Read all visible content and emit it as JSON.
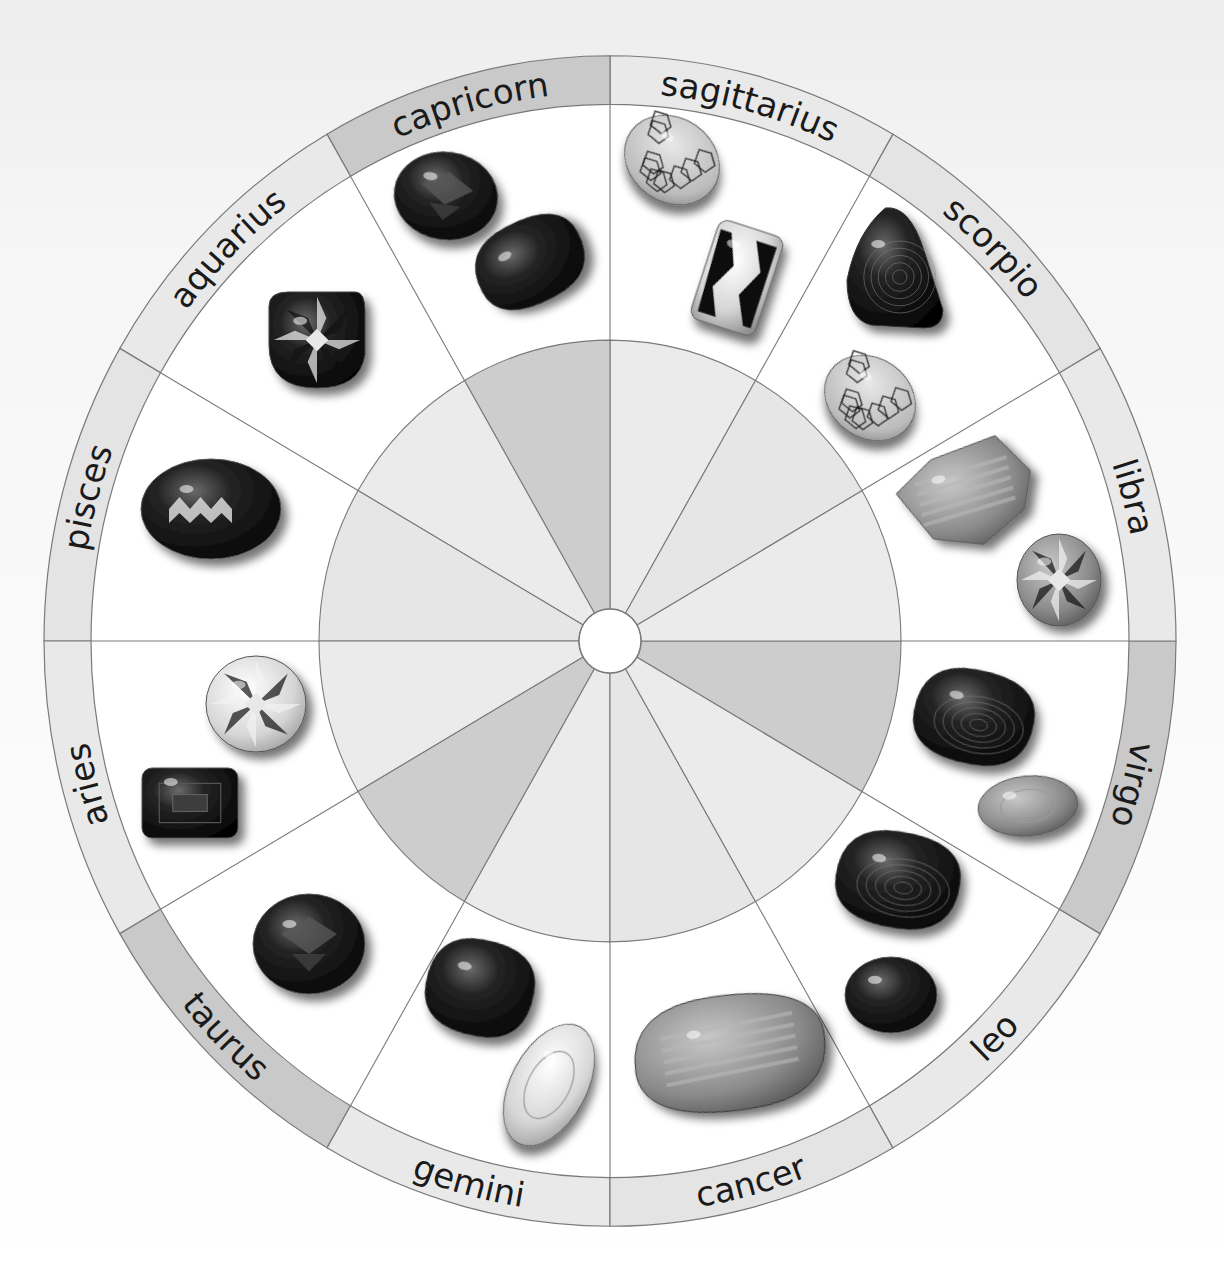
{
  "page": {
    "title_partial": "BIRTHSTONE"
  },
  "wheel": {
    "center": [
      610,
      641
    ],
    "outer_radius": 566,
    "ring_inner_radius": 519,
    "disc_radius": 291,
    "hub_radius": 31,
    "y_stretch": 1.034,
    "colors": {
      "background": "#f4f4f4",
      "ring_light": "#e9e9e9",
      "ring_dark": "#c9c9c9",
      "disc_light": "#ebebeb",
      "disc_dark": "#cdcdcd",
      "line": "#7a7a7a",
      "label": "#1a1a1a"
    }
  },
  "signs": [
    {
      "name": "sagittarius",
      "start_deg": 60,
      "end_deg": 90,
      "shade": "light",
      "flip": false,
      "gems": [
        "turquoise-cabochon",
        "topaz-cushion-cut"
      ]
    },
    {
      "name": "capricorn",
      "start_deg": 90,
      "end_deg": 120,
      "shade": "dark",
      "flip": false,
      "gems": [
        "garnet-cushion-cut",
        "onyx-tumbled"
      ]
    },
    {
      "name": "aquarius",
      "start_deg": 120,
      "end_deg": 150,
      "shade": "light",
      "flip": false,
      "gems": [
        "amethyst-checkerboard-cut"
      ]
    },
    {
      "name": "pisces",
      "start_deg": 150,
      "end_deg": 180,
      "shade": "light",
      "flip": false,
      "gems": [
        "aquamarine-oval-cut"
      ]
    },
    {
      "name": "aries",
      "start_deg": 180,
      "end_deg": 210,
      "shade": "light",
      "flip": false,
      "gems": [
        "diamond-round-brilliant",
        "ruby-emerald-cut"
      ]
    },
    {
      "name": "taurus",
      "start_deg": 210,
      "end_deg": 240,
      "shade": "dark",
      "flip": true,
      "gems": [
        "sapphire-oval-cut"
      ]
    },
    {
      "name": "gemini",
      "start_deg": 240,
      "end_deg": 270,
      "shade": "light",
      "flip": true,
      "gems": [
        "obsidian-tumbled",
        "quartz-oval-cut"
      ]
    },
    {
      "name": "cancer",
      "start_deg": 270,
      "end_deg": 300,
      "shade": "light",
      "flip": true,
      "gems": [
        "moonstone-tumbled"
      ]
    },
    {
      "name": "leo",
      "start_deg": 300,
      "end_deg": 330,
      "shade": "light",
      "flip": true,
      "gems": [
        "tigers-eye-tumbled",
        "cats-eye-cabochon"
      ]
    },
    {
      "name": "virgo",
      "start_deg": 330,
      "end_deg": 360,
      "shade": "dark",
      "flip": false,
      "gems": [
        "agate-tumbled",
        "peridot-oval-cut"
      ]
    },
    {
      "name": "libra",
      "start_deg": 0,
      "end_deg": 30,
      "shade": "light",
      "flip": false,
      "gems": [
        "rose-quartz-rough",
        "opal-round-cut"
      ]
    },
    {
      "name": "scorpio",
      "start_deg": 30,
      "end_deg": 60,
      "shade": "light",
      "flip": false,
      "gems": [
        "banded-agate-tumbled",
        "turquoise-cabochon"
      ]
    }
  ],
  "gems": [
    {
      "id": "sag-1",
      "sign": "sagittarius",
      "type": "turquoise-cabochon",
      "shape": "ellipse",
      "cx": 672,
      "cy": 160,
      "rx": 50,
      "ry": 42,
      "rot": 35,
      "base": "#b9b9b9",
      "pattern": "veins"
    },
    {
      "id": "sag-2",
      "sign": "sagittarius",
      "type": "topaz-cushion-cut",
      "shape": "rect",
      "cx": 737,
      "cy": 278,
      "w": 68,
      "h": 104,
      "rot": 18,
      "base": "#e6e6e6",
      "pattern": "facet-stripes"
    },
    {
      "id": "cap-1",
      "sign": "capricorn",
      "type": "garnet-cushion-cut",
      "shape": "ellipse",
      "cx": 446,
      "cy": 196,
      "rx": 52,
      "ry": 44,
      "rot": 8,
      "base": "#2a2a2a",
      "pattern": "facets-dark"
    },
    {
      "id": "cap-2",
      "sign": "capricorn",
      "type": "onyx-tumbled",
      "shape": "pebble",
      "cx": 530,
      "cy": 262,
      "rx": 56,
      "ry": 42,
      "rot": -28,
      "base": "#121212",
      "pattern": "gloss"
    },
    {
      "id": "aqu-1",
      "sign": "aquarius",
      "type": "amethyst-checkerboard-cut",
      "shape": "cushion",
      "cx": 317,
      "cy": 340,
      "rx": 48,
      "ry": 48,
      "rot": 0,
      "base": "#3a3a3a",
      "pattern": "star"
    },
    {
      "id": "pis-1",
      "sign": "pisces",
      "type": "aquamarine-oval-cut",
      "shape": "ellipse",
      "cx": 211,
      "cy": 509,
      "rx": 70,
      "ry": 50,
      "rot": 0,
      "base": "#2e2e2e",
      "pattern": "zigzag"
    },
    {
      "id": "ari-1",
      "sign": "aries",
      "type": "diamond-round-brilliant",
      "shape": "ellipse",
      "cx": 256,
      "cy": 704,
      "rx": 50,
      "ry": 48,
      "rot": 0,
      "base": "#cfcfcf",
      "pattern": "brilliant"
    },
    {
      "id": "ari-2",
      "sign": "aries",
      "type": "ruby-emerald-cut",
      "shape": "rect",
      "cx": 190,
      "cy": 803,
      "w": 96,
      "h": 70,
      "rot": 0,
      "base": "#222222",
      "pattern": "step"
    },
    {
      "id": "tau-1",
      "sign": "taurus",
      "type": "sapphire-oval-cut",
      "shape": "ellipse",
      "cx": 309,
      "cy": 944,
      "rx": 56,
      "ry": 50,
      "rot": 0,
      "base": "#1e1e1e",
      "pattern": "facets-dark"
    },
    {
      "id": "gem-1",
      "sign": "gemini",
      "type": "obsidian-tumbled",
      "shape": "pebble",
      "cx": 480,
      "cy": 988,
      "rx": 54,
      "ry": 48,
      "rot": 10,
      "base": "#0e0e0e",
      "pattern": "gloss"
    },
    {
      "id": "gem-2",
      "sign": "gemini",
      "type": "quartz-oval-cut",
      "shape": "ellipse",
      "cx": 549,
      "cy": 1085,
      "rx": 38,
      "ry": 66,
      "rot": 28,
      "base": "#e4e4e4",
      "pattern": "clear"
    },
    {
      "id": "can-1",
      "sign": "cancer",
      "type": "moonstone-tumbled",
      "shape": "pebble",
      "cx": 730,
      "cy": 1053,
      "rx": 96,
      "ry": 58,
      "rot": -8,
      "base": "#8c8c8c",
      "pattern": "streaks"
    },
    {
      "id": "leo-1",
      "sign": "leo",
      "type": "tigers-eye-tumbled",
      "shape": "pebble",
      "cx": 898,
      "cy": 880,
      "rx": 62,
      "ry": 48,
      "rot": 8,
      "base": "#1a1a1a",
      "pattern": "bands"
    },
    {
      "id": "leo-2",
      "sign": "leo",
      "type": "cats-eye-cabochon",
      "shape": "ellipse",
      "cx": 891,
      "cy": 995,
      "rx": 46,
      "ry": 38,
      "rot": 0,
      "base": "#2a2a2a",
      "pattern": "gloss"
    },
    {
      "id": "vir-1",
      "sign": "virgo",
      "type": "agate-tumbled",
      "shape": "pebble",
      "cx": 974,
      "cy": 717,
      "rx": 60,
      "ry": 47,
      "rot": 10,
      "base": "#0f0f0f",
      "pattern": "agate"
    },
    {
      "id": "vir-2",
      "sign": "virgo",
      "type": "peridot-oval-cut",
      "shape": "ellipse",
      "cx": 1028,
      "cy": 806,
      "rx": 50,
      "ry": 30,
      "rot": -5,
      "base": "#b4b4b4",
      "pattern": "clear"
    },
    {
      "id": "lib-1",
      "sign": "libra",
      "type": "rose-quartz-rough",
      "shape": "rough",
      "cx": 966,
      "cy": 495,
      "rx": 68,
      "ry": 52,
      "rot": -12,
      "base": "#8d8d8d",
      "pattern": "rough"
    },
    {
      "id": "lib-2",
      "sign": "libra",
      "type": "opal-round-cut",
      "shape": "ellipse",
      "cx": 1059,
      "cy": 580,
      "rx": 42,
      "ry": 46,
      "rot": 0,
      "base": "#8a8a8a",
      "pattern": "brilliant"
    },
    {
      "id": "sco-1",
      "sign": "scorpio",
      "type": "banded-agate-tumbled",
      "shape": "triangle",
      "cx": 895,
      "cy": 268,
      "rx": 48,
      "ry": 60,
      "rot": 0,
      "base": "#333333",
      "pattern": "bands"
    },
    {
      "id": "sco-2",
      "sign": "scorpio",
      "type": "turquoise-cabochon",
      "shape": "ellipse",
      "cx": 870,
      "cy": 398,
      "rx": 48,
      "ry": 40,
      "rot": 35,
      "base": "#b4b4b4",
      "pattern": "veins"
    }
  ]
}
